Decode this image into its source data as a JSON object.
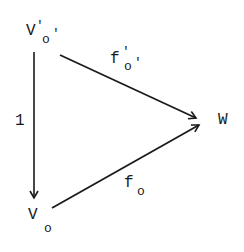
{
  "diagram": {
    "type": "commutative-triangle",
    "nodes": {
      "top_left": {
        "base": "V",
        "prime": "'",
        "sub": "o",
        "sub_prime": "'"
      },
      "bottom_left": {
        "base": "V",
        "sub": "o"
      },
      "right": {
        "base": "W"
      }
    },
    "edges": {
      "top": {
        "from": "top_left",
        "to": "right",
        "label_base": "f",
        "label_prime": "'",
        "label_sub": "o",
        "label_sub_prime": "'"
      },
      "vertical": {
        "from": "top_left",
        "to": "bottom_left",
        "label": "1"
      },
      "bottom": {
        "from": "bottom_left",
        "to": "right",
        "label_base": "f",
        "label_sub": "o"
      }
    },
    "colors": {
      "ink": "#1a1a1a",
      "background": "#ffffff"
    }
  }
}
